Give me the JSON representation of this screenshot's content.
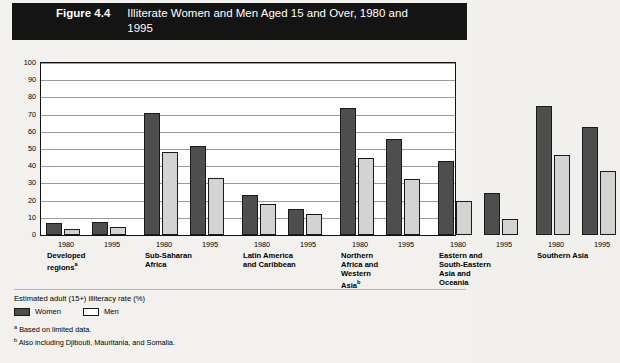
{
  "banner": {
    "figure_number": "Figure 4.4",
    "title": "Illiterate Women and Men Aged 15 and Over, 1980 and 1995"
  },
  "footer": {
    "caption": "Estimated adult (15+) illiteracy rate (%)",
    "legend": [
      {
        "key": "women",
        "label": "Women",
        "color": "#4e4e4e"
      },
      {
        "key": "men",
        "label": "Men",
        "color": "#d3d3d3"
      }
    ],
    "notes": [
      {
        "marker": "a",
        "text": "Based on limited data."
      },
      {
        "marker": "b",
        "text": "Also including Djibouti, Mauritania, and Somalia."
      }
    ]
  },
  "chart_data": {
    "type": "bar",
    "title": "Illiterate Women and Men Aged 15 and Over, 1980 and 1995",
    "xlabel": "",
    "ylabel": "",
    "ylim": [
      0,
      100
    ],
    "ytick_step": 10,
    "yticks": [
      0,
      10,
      20,
      30,
      40,
      50,
      60,
      70,
      80,
      90,
      100
    ],
    "grid": true,
    "legend_position": "below-plot",
    "series": [
      {
        "name": "Women",
        "color": "#4e4e4e"
      },
      {
        "name": "Men",
        "color": "#d3d3d3"
      }
    ],
    "years": [
      "1980",
      "1995"
    ],
    "groups": [
      {
        "label": "Developed regions",
        "footnote": "a",
        "label_lines": [
          "Developed",
          "regions"
        ],
        "points": [
          {
            "year": "1980",
            "women": 7,
            "men": 3.5
          },
          {
            "year": "1995",
            "women": 7.5,
            "men": 4.5
          }
        ]
      },
      {
        "label": "Sub-Saharan Africa",
        "footnote": "",
        "label_lines": [
          "Sub-Saharan",
          "Africa"
        ],
        "points": [
          {
            "year": "1980",
            "women": 71,
            "men": 48
          },
          {
            "year": "1995",
            "women": 52,
            "men": 33
          }
        ]
      },
      {
        "label": "Latin America and Caribbean",
        "footnote": "",
        "label_lines": [
          "Latin America",
          "and Caribbean"
        ],
        "points": [
          {
            "year": "1980",
            "women": 23,
            "men": 18
          },
          {
            "year": "1995",
            "women": 15,
            "men": 12.5
          }
        ]
      },
      {
        "label": "Northern Africa and Western Asia",
        "footnote": "b",
        "label_lines": [
          "Northern",
          "Africa and",
          "Western",
          "Asia"
        ],
        "points": [
          {
            "year": "1980",
            "women": 74,
            "men": 45
          },
          {
            "year": "1995",
            "women": 56,
            "men": 32.5
          }
        ]
      },
      {
        "label": "Eastern and South-Eastern Asia and Oceania",
        "footnote": "",
        "label_lines": [
          "Eastern and",
          "South-Eastern",
          "Asia and",
          "Oceania"
        ],
        "points": [
          {
            "year": "1980",
            "women": 43,
            "men": 20
          },
          {
            "year": "1995",
            "women": 24.5,
            "men": 9.5
          }
        ]
      },
      {
        "label": "Southern Asia",
        "footnote": "",
        "label_lines": [
          "Southern Asia"
        ],
        "points": [
          {
            "year": "1980",
            "women": 75,
            "men": 46.5
          },
          {
            "year": "1995",
            "women": 63,
            "men": 37
          }
        ]
      }
    ]
  }
}
